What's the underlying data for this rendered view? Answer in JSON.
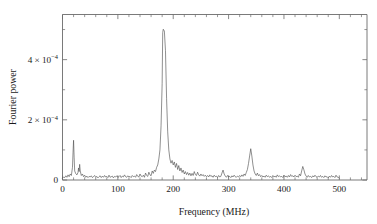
{
  "chart_data": {
    "type": "line",
    "title": "",
    "xlabel": "Frequency (MHz)",
    "ylabel": "Fourier power",
    "xlim": [
      0,
      550
    ],
    "ylim": [
      0,
      0.00055
    ],
    "grid": false,
    "legend": null,
    "xticks": [
      0,
      100,
      200,
      300,
      400,
      500
    ],
    "xtick_labels": [
      "0",
      "100",
      "200",
      "300",
      "400",
      "500"
    ],
    "xminor_step": 20,
    "yticks": [
      0,
      0.0002,
      0.0004
    ],
    "ytick_labels": [
      "0",
      "2 × 10⁻⁴",
      "4 × 10⁻⁴"
    ],
    "ytick_label_parts": [
      {
        "mantissa": "0",
        "times": "",
        "base": "",
        "exponent": ""
      },
      {
        "mantissa": "2",
        "times": "×",
        "base": "10",
        "exponent": "−4"
      },
      {
        "mantissa": "4",
        "times": "×",
        "base": "10",
        "exponent": "−4"
      }
    ],
    "yminor_step": 0.0001,
    "annotations": [
      {
        "text": "ν",
        "sub": "12",
        "x": 55,
        "y": 0.00255,
        "name": "nu-12-label"
      },
      {
        "text": "ν",
        "sub": "34",
        "x": 320,
        "y": 0.00215,
        "name": "nu-34-label"
      }
    ],
    "peaks": [
      {
        "name": "nu_12",
        "frequency": 20,
        "power": 0.000132
      },
      {
        "name": "nu_12_sideband",
        "frequency": 31,
        "power": 5.2e-05
      },
      {
        "name": "main",
        "frequency": 181,
        "power": 0.000501
      },
      {
        "name": "nu_34",
        "frequency": 348,
        "power": 0.000104
      }
    ],
    "x": [
      0,
      2,
      4,
      6,
      8,
      10,
      12,
      14,
      16,
      18,
      19,
      20,
      21,
      22,
      24,
      26,
      28,
      29,
      30,
      31,
      32,
      34,
      36,
      38,
      40,
      42,
      44,
      46,
      48,
      50,
      52,
      54,
      56,
      58,
      60,
      62,
      64,
      66,
      68,
      70,
      72,
      74,
      76,
      78,
      80,
      82,
      84,
      86,
      88,
      90,
      92,
      94,
      96,
      98,
      100,
      102,
      104,
      106,
      108,
      110,
      112,
      114,
      116,
      118,
      120,
      122,
      124,
      126,
      128,
      130,
      132,
      134,
      136,
      138,
      140,
      142,
      144,
      146,
      148,
      150,
      152,
      154,
      156,
      158,
      160,
      162,
      164,
      166,
      168,
      170,
      172,
      174,
      176,
      178,
      180,
      181,
      182,
      184,
      186,
      188,
      190,
      192,
      194,
      196,
      198,
      200,
      202,
      204,
      206,
      208,
      210,
      212,
      214,
      216,
      218,
      220,
      222,
      224,
      226,
      228,
      230,
      232,
      234,
      236,
      238,
      240,
      242,
      244,
      246,
      248,
      250,
      252,
      254,
      256,
      258,
      260,
      262,
      264,
      266,
      268,
      270,
      272,
      274,
      276,
      278,
      280,
      282,
      284,
      286,
      288,
      290,
      292,
      294,
      296,
      298,
      300,
      302,
      304,
      306,
      308,
      310,
      312,
      314,
      316,
      318,
      320,
      322,
      324,
      326,
      328,
      330,
      332,
      334,
      336,
      338,
      340,
      342,
      344,
      346,
      348,
      350,
      352,
      354,
      356,
      358,
      360,
      362,
      364,
      366,
      368,
      370,
      372,
      374,
      376,
      378,
      380,
      382,
      384,
      386,
      388,
      390,
      392,
      394,
      396,
      398,
      400,
      402,
      404,
      406,
      408,
      410,
      412,
      414,
      416,
      418,
      420,
      422,
      424,
      426,
      428,
      430,
      432,
      434,
      436,
      438,
      440,
      442,
      444,
      446,
      448,
      450,
      452,
      454,
      456,
      458,
      460,
      462,
      464,
      466,
      468,
      470,
      472,
      474,
      476,
      478,
      480,
      482,
      484,
      486,
      488,
      490,
      492,
      494,
      496,
      498,
      500,
      502,
      504,
      506,
      508,
      510
    ],
    "y": [
      6e-06,
      1e-05,
      8e-06,
      1.4e-05,
      9e-06,
      1.7e-05,
      1.1e-05,
      2e-05,
      1.5e-05,
      4.2e-05,
      9e-05,
      0.000132,
      7.6e-05,
      3e-05,
      2.1e-05,
      1.7e-05,
      2.5e-05,
      4e-05,
      2.8e-05,
      5.2e-05,
      3e-05,
      1.5e-05,
      2e-05,
      1.1e-05,
      1.6e-05,
      9e-06,
      1.3e-05,
      8e-06,
      1.2e-05,
      1e-05,
      1.4e-05,
      8e-06,
      1.1e-05,
      1.5e-05,
      9e-06,
      1.2e-05,
      7e-06,
      1.1e-05,
      1.4e-05,
      8e-06,
      1.3e-05,
      9e-06,
      1.5e-05,
      1e-05,
      1.2e-05,
      8e-06,
      1.6e-05,
      9e-06,
      1.1e-05,
      1.3e-05,
      7e-06,
      1.2e-05,
      1e-05,
      1.4e-05,
      9e-06,
      1.1e-05,
      1.5e-05,
      8e-06,
      1.3e-05,
      1e-05,
      1.7e-05,
      1.1e-05,
      9e-06,
      1.4e-05,
      1e-05,
      1.2e-05,
      8e-06,
      1.5e-05,
      1.1e-05,
      1.3e-05,
      9e-06,
      1.8e-05,
      1.2e-05,
      1e-05,
      2e-05,
      1.3e-05,
      1.1e-05,
      1.6e-05,
      9e-06,
      2.3e-05,
      1.5e-05,
      1.2e-05,
      2.6e-05,
      1.7e-05,
      1.4e-05,
      3e-05,
      2.2e-05,
      3.3e-05,
      2.8e-05,
      4.2e-05,
      5e-05,
      7e-05,
      0.0001,
      0.00018,
      0.00032,
      0.00049,
      0.000501,
      0.000495,
      0.00043,
      0.00027,
      0.00016,
      0.0001,
      7e-05,
      5.6e-05,
      6.5e-05,
      5e-05,
      6e-05,
      4.2e-05,
      5.5e-05,
      3.5e-05,
      4.8e-05,
      3e-05,
      4e-05,
      2.5e-05,
      3.3e-05,
      2e-05,
      2.8e-05,
      1.8e-05,
      2.5e-05,
      1.6e-05,
      2.3e-05,
      1.4e-05,
      2.2e-05,
      1.5e-05,
      2.8e-05,
      1.8e-05,
      1.5e-05,
      2.6e-05,
      1.7e-05,
      1.3e-05,
      2e-05,
      1.4e-05,
      1.8e-05,
      1.2e-05,
      1.6e-05,
      1.1e-05,
      1.5e-05,
      1e-05,
      1.7e-05,
      1.2e-05,
      1.4e-05,
      9e-06,
      1.6e-05,
      1.1e-05,
      1.3e-05,
      8e-06,
      1.5e-05,
      1e-05,
      1.2e-05,
      2.3e-05,
      3.3e-05,
      2e-05,
      1.3e-05,
      9e-06,
      1.5e-05,
      1e-05,
      1.2e-05,
      8e-06,
      1.4e-05,
      1e-05,
      1.6e-05,
      1.1e-05,
      9e-06,
      1.3e-05,
      1e-05,
      1.5e-05,
      1.1e-05,
      1.7e-05,
      1.2e-05,
      2e-05,
      1.5e-05,
      2.5e-05,
      3.5e-05,
      5.5e-05,
      8e-05,
      0.000104,
      8e-05,
      5e-05,
      3e-05,
      2e-05,
      1.5e-05,
      2.3e-05,
      1.4e-05,
      1.8e-05,
      1.1e-05,
      1.5e-05,
      1e-05,
      1.3e-05,
      9e-06,
      1.6e-05,
      1.1e-05,
      1.4e-05,
      9e-06,
      1.2e-05,
      8e-06,
      1.5e-05,
      1e-05,
      1.3e-05,
      9e-06,
      1.7e-05,
      1.1e-05,
      1.4e-05,
      1e-05,
      1.2e-05,
      8e-06,
      1.6e-05,
      1.1e-05,
      1.3e-05,
      9e-06,
      1.5e-05,
      1e-05,
      1.8e-05,
      1.2e-05,
      1.4e-05,
      1e-05,
      1.6e-05,
      1.1e-05,
      1.3e-05,
      9e-06,
      2e-05,
      1.4e-05,
      3e-05,
      4.5e-05,
      3.4e-05,
      2e-05,
      1.3e-05,
      9e-06,
      1.5e-05,
      1e-05,
      1.2e-05,
      8e-06,
      1.4e-05,
      1e-05,
      1.6e-05,
      1.1e-05,
      9e-06,
      1.3e-05,
      1e-05,
      1.5e-05,
      9e-06,
      1.2e-05,
      8e-06,
      1.4e-05,
      1e-05,
      1.1e-05,
      7e-06,
      1.3e-05,
      9e-06,
      1.5e-05,
      1e-05,
      1.2e-05,
      8e-06,
      1.6e-05,
      1e-05,
      9e-06,
      6e-06
    ]
  }
}
